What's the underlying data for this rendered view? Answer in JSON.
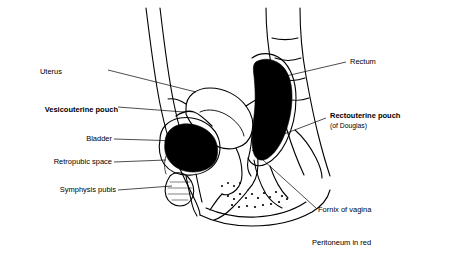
{
  "figure": {
    "view_box": "0 0 453 261",
    "background": "#ffffff",
    "line_color": "#000000",
    "fill_color": "#000000",
    "note_color": "#000000"
  },
  "labels": [
    {
      "id": "uterus",
      "text": "Uterus",
      "bold": false,
      "align": "right",
      "x": 62,
      "y": 72
    },
    {
      "id": "vesicouterine",
      "text": "Vesicouterine pouch",
      "bold": true,
      "align": "right",
      "x": 14,
      "y": 110
    },
    {
      "id": "bladder",
      "text": "Bladder",
      "bold": false,
      "align": "right",
      "x": 80,
      "y": 139
    },
    {
      "id": "retropubic",
      "text": "Retropubic space",
      "bold": false,
      "align": "right",
      "x": 47,
      "y": 162
    },
    {
      "id": "symphysis",
      "text": "Symphysis pubis",
      "bold": false,
      "align": "right",
      "x": 51,
      "y": 192
    },
    {
      "id": "rectum",
      "text": "Rectum",
      "bold": false,
      "align": "left",
      "x": 350,
      "y": 63
    },
    {
      "id": "rectouterine",
      "text": "Rectouterine pouch",
      "bold": true,
      "align": "left",
      "x": 330,
      "y": 116
    },
    {
      "id": "rectouterine_sub",
      "text": "(of Douglas)",
      "bold": false,
      "align": "left",
      "x": 330,
      "y": 126
    },
    {
      "id": "fornix",
      "text": "Fornix of vagina",
      "bold": false,
      "align": "left",
      "x": 318,
      "y": 211
    },
    {
      "id": "peritoneum",
      "text": "Peritoneum in red",
      "bold": false,
      "align": "left",
      "x": 312,
      "y": 243
    }
  ]
}
